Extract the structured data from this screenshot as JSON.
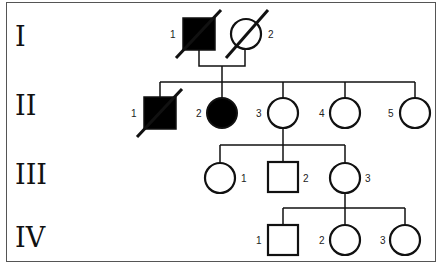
{
  "diagram": {
    "type": "pedigree",
    "generations": [
      {
        "label": "I",
        "y": 45
      },
      {
        "label": "II",
        "y": 114
      },
      {
        "label": "III",
        "y": 183
      },
      {
        "label": "IV",
        "y": 246
      }
    ],
    "individuals": [
      {
        "id": "I-1",
        "gen": "I",
        "num": "1",
        "sex": "male",
        "affected": true,
        "deceased": true
      },
      {
        "id": "I-2",
        "gen": "I",
        "num": "2",
        "sex": "female",
        "affected": false,
        "deceased": true
      },
      {
        "id": "II-1",
        "gen": "II",
        "num": "1",
        "sex": "male",
        "affected": true,
        "deceased": true
      },
      {
        "id": "II-2",
        "gen": "II",
        "num": "2",
        "sex": "female",
        "affected": true,
        "deceased": false
      },
      {
        "id": "II-3",
        "gen": "II",
        "num": "3",
        "sex": "female",
        "affected": false,
        "deceased": false
      },
      {
        "id": "II-4",
        "gen": "II",
        "num": "4",
        "sex": "female",
        "affected": false,
        "deceased": false
      },
      {
        "id": "II-5",
        "gen": "II",
        "num": "5",
        "sex": "female",
        "affected": false,
        "deceased": false
      },
      {
        "id": "III-1",
        "gen": "III",
        "num": "1",
        "sex": "female",
        "affected": false,
        "deceased": false
      },
      {
        "id": "III-2",
        "gen": "III",
        "num": "2",
        "sex": "male",
        "affected": false,
        "deceased": false
      },
      {
        "id": "III-3",
        "gen": "III",
        "num": "3",
        "sex": "female",
        "affected": false,
        "deceased": false
      },
      {
        "id": "IV-1",
        "gen": "IV",
        "num": "1",
        "sex": "male",
        "affected": false,
        "deceased": false
      },
      {
        "id": "IV-2",
        "gen": "IV",
        "num": "2",
        "sex": "female",
        "affected": false,
        "deceased": false
      },
      {
        "id": "IV-3",
        "gen": "IV",
        "num": "3",
        "sex": "female",
        "affected": false,
        "deceased": false
      }
    ],
    "relationships": [
      {
        "type": "mating",
        "partners": [
          "I-1",
          "I-2"
        ],
        "children": [
          "II-1",
          "II-2",
          "II-3",
          "II-4",
          "II-5"
        ]
      },
      {
        "type": "parent",
        "parent": "II-3",
        "children": [
          "III-1",
          "III-2",
          "III-3"
        ]
      },
      {
        "type": "parent",
        "parent": "III-3",
        "children": [
          "IV-1",
          "IV-2",
          "IV-3"
        ]
      }
    ],
    "colors": {
      "stroke": "#111111",
      "affected_fill": "#000000",
      "unaffected_fill": "#ffffff"
    }
  }
}
